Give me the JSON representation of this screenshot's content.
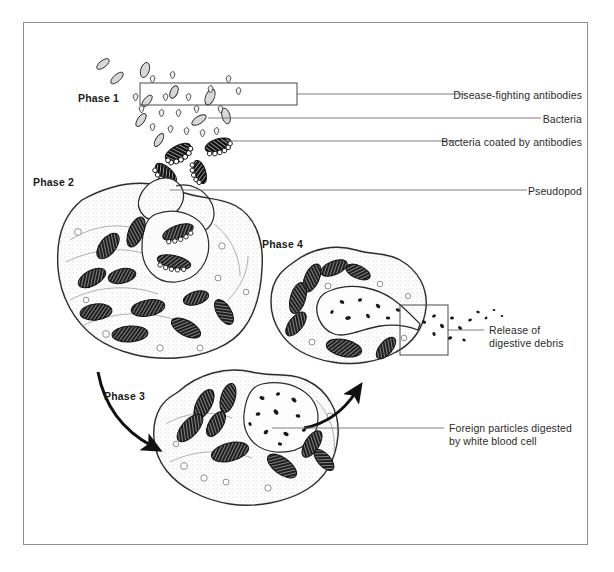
{
  "figure": {
    "frame_color": "#8e8e90",
    "ink_color": "#1a1a1a",
    "background": "#ffffff"
  },
  "phases": [
    {
      "id": "phase-1",
      "label": "Phase 1",
      "x": 78,
      "y": 92
    },
    {
      "id": "phase-2",
      "label": "Phase 2",
      "x": 33,
      "y": 176
    },
    {
      "id": "phase-3",
      "label": "Phase 3",
      "x": 104,
      "y": 390
    },
    {
      "id": "phase-4",
      "label": "Phase 4",
      "x": 262,
      "y": 238
    }
  ],
  "callouts": [
    {
      "id": "disease-fighting-antibodies",
      "text": "Disease-fighting antibodies",
      "label_right": 582,
      "label_y": 89,
      "leader_y": 94,
      "leader_from": 297,
      "leader_to": 466,
      "bracket": {
        "x": 140,
        "y": 83,
        "w": 157,
        "h": 22
      }
    },
    {
      "id": "bacteria",
      "text": "Bacteria",
      "label_right": 582,
      "label_y": 113,
      "leader_y": 118,
      "leader_from": 208,
      "leader_to": 541,
      "bracket": null
    },
    {
      "id": "bacteria-coated-by-antibodies",
      "text": "Bacteria coated by antibodies",
      "label_right": 582,
      "label_y": 136,
      "leader_y": 141,
      "leader_from": 222,
      "leader_to": 460,
      "bracket": null
    },
    {
      "id": "pseudopod",
      "text": "Pseudopod",
      "label_right": 582,
      "label_y": 185,
      "leader_y": 190,
      "leader_from": 170,
      "leader_to": 527,
      "bracket": null
    },
    {
      "id": "release-of-digestive-debris",
      "text": "Release of\ndigestive debris",
      "line1": "Release of",
      "line2": "digestive debris",
      "label_left": 489,
      "label_y": 324,
      "leader_y": 330,
      "leader_from": 448,
      "leader_to": 484,
      "bracket": {
        "x": 400,
        "y": 305,
        "w": 48,
        "h": 50
      }
    },
    {
      "id": "foreign-particles-digested",
      "text": "Foreign particles digested\nby white blood cell",
      "line1": "Foreign particles digested",
      "line2": "by white blood cell",
      "label_left": 449,
      "label_y": 422,
      "leader_y": 428,
      "leader_from": 272,
      "leader_to": 444,
      "bracket": null
    }
  ],
  "arrows": [
    {
      "id": "arrow-phase2-to-phase3",
      "direction": "down-right"
    },
    {
      "id": "arrow-phase3-to-phase4",
      "direction": "up-right"
    }
  ],
  "cells": [
    {
      "id": "cell-phase-2",
      "name": "white-blood-cell-phase-2"
    },
    {
      "id": "cell-phase-3",
      "name": "white-blood-cell-phase-3"
    },
    {
      "id": "cell-phase-4",
      "name": "white-blood-cell-phase-4"
    }
  ]
}
